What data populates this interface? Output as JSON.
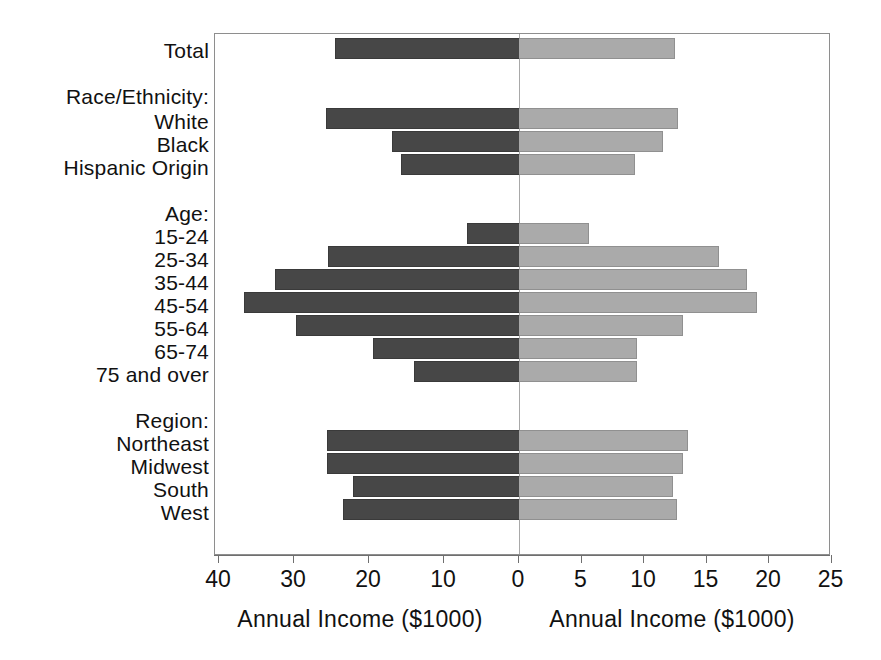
{
  "chart_data": {
    "type": "bar",
    "orientation": "horizontal",
    "subtype": "population-pyramid-style back-to-back bar chart",
    "title": "",
    "left_panel": {
      "xlabel": "Annual Income ($1000)",
      "tick_labels": [
        "40",
        "30",
        "20",
        "10",
        "0"
      ],
      "tick_values": [
        40,
        30,
        20,
        10,
        0
      ],
      "axis_range": [
        40,
        0
      ],
      "direction": "right-to-left",
      "series_name": "Men",
      "bar_color": "#474747"
    },
    "right_panel": {
      "xlabel": "Annual Income ($1000)",
      "tick_labels": [
        "0",
        "5",
        "10",
        "15",
        "20",
        "25"
      ],
      "tick_values": [
        0,
        5,
        10,
        15,
        20,
        25
      ],
      "axis_range": [
        0,
        25
      ],
      "direction": "left-to-right",
      "series_name": "Women",
      "bar_color": "#aaaaaa"
    },
    "grid": false,
    "legend": "none",
    "rows": [
      {
        "label": "Total",
        "kind": "bar",
        "left": 24.5,
        "right": 12.5
      },
      {
        "label": "Race/Ethnicity:",
        "kind": "header",
        "left": null,
        "right": null
      },
      {
        "label": "White",
        "kind": "bar",
        "left": 25.7,
        "right": 12.7
      },
      {
        "label": "Black",
        "kind": "bar",
        "left": 17.0,
        "right": 11.5
      },
      {
        "label": "Hispanic Origin",
        "kind": "bar",
        "left": 15.7,
        "right": 9.3
      },
      {
        "label": "Age:",
        "kind": "header",
        "left": null,
        "right": null
      },
      {
        "label": "15-24",
        "kind": "bar",
        "left": 7.0,
        "right": 5.6
      },
      {
        "label": "25-34",
        "kind": "bar",
        "left": 25.5,
        "right": 16.0
      },
      {
        "label": "35-44",
        "kind": "bar",
        "left": 32.5,
        "right": 18.2
      },
      {
        "label": "45-54",
        "kind": "bar",
        "left": 36.7,
        "right": 19.0
      },
      {
        "label": "55-64",
        "kind": "bar",
        "left": 29.7,
        "right": 13.1
      },
      {
        "label": "65-74",
        "kind": "bar",
        "left": 19.5,
        "right": 9.4
      },
      {
        "label": "75 and over",
        "kind": "bar",
        "left": 14.0,
        "right": 9.4
      },
      {
        "label": "Region:",
        "kind": "header",
        "left": null,
        "right": null
      },
      {
        "label": "Northeast",
        "kind": "bar",
        "left": 25.6,
        "right": 13.5
      },
      {
        "label": "Midwest",
        "kind": "bar",
        "left": 25.6,
        "right": 13.1
      },
      {
        "label": "South",
        "kind": "bar",
        "left": 22.1,
        "right": 12.3
      },
      {
        "label": "West",
        "kind": "bar",
        "left": 23.5,
        "right": 12.6
      }
    ]
  },
  "layout": {
    "rows_y": [
      37,
      73,
      107,
      130,
      153,
      201,
      222,
      245,
      268,
      291,
      314,
      337,
      360,
      408,
      429,
      452,
      475,
      498
    ],
    "label_y": [
      40,
      86,
      111,
      134,
      157,
      203,
      226,
      249,
      272,
      295,
      318,
      341,
      364,
      410,
      433,
      456,
      479,
      502
    ],
    "zero_x": 518,
    "left_px_per_unit": 7.5,
    "right_px_per_unit": 12.5,
    "plot_left": 214,
    "plot_right": 830,
    "bar_height": 21
  },
  "colors": {
    "bar_left": "#474747",
    "bar_right": "#aaaaaa",
    "axis": "#6f6f6f",
    "text": "#111111",
    "background": "#ffffff"
  }
}
